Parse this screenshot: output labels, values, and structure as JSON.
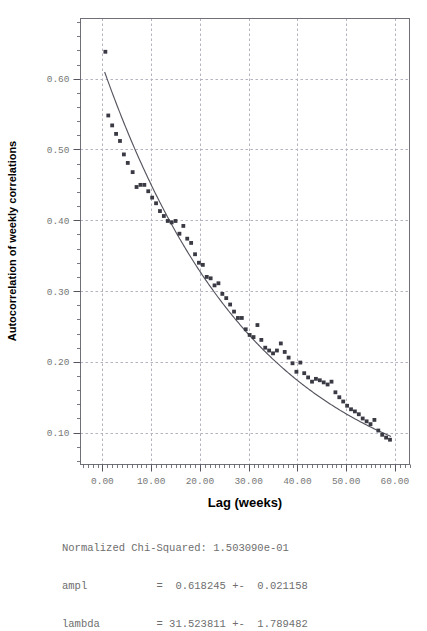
{
  "chart_data": {
    "type": "scatter",
    "title": "",
    "xlabel": "Lag (weeks)",
    "ylabel": "Autocorrelation of weekly correlations",
    "xlim": [
      -4.5,
      63.0
    ],
    "ylim": [
      0.055,
      0.685
    ],
    "grid": true,
    "legend": false,
    "xticks": [
      0,
      10,
      20,
      30,
      40,
      50,
      60
    ],
    "xticklabels": [
      "0.00",
      "10.00",
      "20.00",
      "30.00",
      "40.00",
      "50.00",
      "60.00"
    ],
    "yticks": [
      0.1,
      0.2,
      0.3,
      0.4,
      0.5,
      0.6
    ],
    "yticklabels": [
      "0.10",
      "0.20",
      "0.30",
      "0.40",
      "0.50",
      "0.60"
    ],
    "marker_color": "#3a3a44",
    "curve_color": "#555560",
    "grid_color": "#b4b4c0",
    "frame_color": "#707078",
    "x": [
      0.6,
      1.2,
      2.0,
      2.8,
      3.6,
      4.4,
      5.2,
      6.2,
      7.0,
      7.8,
      8.6,
      9.4,
      10.2,
      11.0,
      11.8,
      12.6,
      13.4,
      14.2,
      15.0,
      15.8,
      16.6,
      17.4,
      18.2,
      19.0,
      19.8,
      20.6,
      21.4,
      22.2,
      23.0,
      23.8,
      24.6,
      25.4,
      26.2,
      27.0,
      27.8,
      28.6,
      29.4,
      30.2,
      31.0,
      31.8,
      32.6,
      33.4,
      34.2,
      35.0,
      35.8,
      36.6,
      37.4,
      38.2,
      39.0,
      39.8,
      40.6,
      41.4,
      42.2,
      43.0,
      43.8,
      44.6,
      45.4,
      46.2,
      47.0,
      47.8,
      48.6,
      49.4,
      50.2,
      51.0,
      51.8,
      52.6,
      53.4,
      54.2,
      55.0,
      55.8,
      56.6,
      57.4,
      58.2,
      59.0
    ],
    "y": [
      0.638,
      0.548,
      0.534,
      0.522,
      0.512,
      0.493,
      0.481,
      0.468,
      0.447,
      0.45,
      0.45,
      0.441,
      0.432,
      0.424,
      0.413,
      0.406,
      0.399,
      0.397,
      0.399,
      0.381,
      0.392,
      0.374,
      0.368,
      0.352,
      0.34,
      0.337,
      0.32,
      0.318,
      0.308,
      0.311,
      0.296,
      0.29,
      0.281,
      0.271,
      0.262,
      0.262,
      0.246,
      0.238,
      0.235,
      0.252,
      0.231,
      0.22,
      0.216,
      0.212,
      0.216,
      0.226,
      0.214,
      0.206,
      0.198,
      0.186,
      0.199,
      0.184,
      0.178,
      0.172,
      0.176,
      0.174,
      0.171,
      0.168,
      0.172,
      0.157,
      0.15,
      0.144,
      0.138,
      0.133,
      0.13,
      0.126,
      0.12,
      0.116,
      0.112,
      0.118,
      0.103,
      0.097,
      0.093,
      0.09
    ],
    "fit": {
      "function": "ampl * exp(-x / lambda)",
      "ampl": 0.618245,
      "lambda": 31.523811
    }
  },
  "fit_results": {
    "line1": "Normalized Chi-Squared: 1.503090e-01",
    "line2": "ampl           =  0.618245 +-  0.021158",
    "line3": "lambda         = 31.523811 +-  1.789482",
    "chi_squared_label": "Normalized Chi-Squared:",
    "chi_squared_value": "1.503090e-01",
    "ampl_label": "ampl",
    "ampl_value": "0.618245",
    "ampl_error": "0.021158",
    "lambda_label": "lambda",
    "lambda_value": "31.523811",
    "lambda_error": "1.789482"
  }
}
